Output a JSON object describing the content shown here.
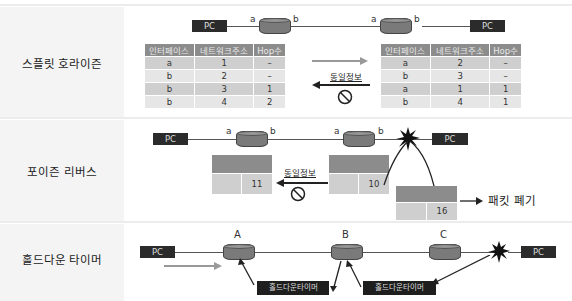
{
  "sections": [
    {
      "title": "스플릿 호라이즌",
      "left_pc": "PC",
      "right_pc": "PC",
      "ports": [
        "a",
        "b",
        "a",
        "b"
      ],
      "table_headers": [
        "인터페이스",
        "네트워크주소",
        "Hop수"
      ],
      "left_table": [
        [
          "a",
          "1",
          "–"
        ],
        [
          "b",
          "2",
          "–"
        ],
        [
          "b",
          "3",
          "1"
        ],
        [
          "b",
          "4",
          "2"
        ]
      ],
      "right_table": [
        [
          "a",
          "2",
          "–"
        ],
        [
          "b",
          "3",
          "–"
        ],
        [
          "a",
          "1",
          "1"
        ],
        [
          "b",
          "4",
          "1"
        ]
      ],
      "blocked_label": "동일정보"
    },
    {
      "title": "포이즌 리버스",
      "left_pc": "PC",
      "right_pc": "PC",
      "ports": [
        "a",
        "b",
        "a",
        "b"
      ],
      "left_cell_value": "11",
      "mid_cell_value": "10",
      "drop_cell_value": "16",
      "blocked_label": "동일정보",
      "drop_label": "패킷 폐기"
    },
    {
      "title": "홀드다운 타이머",
      "left_pc": "PC",
      "right_pc": "PC",
      "routers": [
        "A",
        "B",
        "C"
      ],
      "timer_labels": [
        "홀드다운타이머",
        "홀드다운타이머"
      ]
    }
  ],
  "colors": {
    "router": "#7a7a7a",
    "pc_box": "#2b2b2b",
    "table_header": "#8c8c8c",
    "row_dark": "#cfcfcf",
    "row_light": "#e6e6e6",
    "label_bg": "#f4f4f4"
  }
}
